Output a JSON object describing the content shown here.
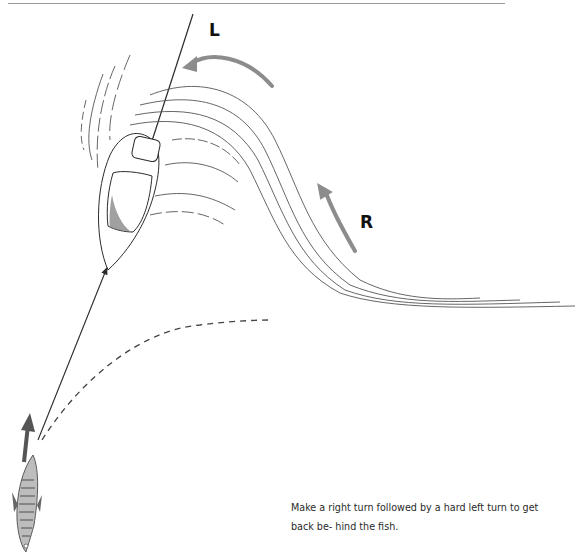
{
  "figure": {
    "turn_labels": {
      "left": "L",
      "right": "R"
    },
    "elements": {
      "boat": "boat-top-view",
      "fishing_line": "line-to-fish",
      "wake": "boat-wake",
      "fish": "fish-top-view",
      "fish_direction": "fish-arrow-up",
      "path": "dashed-boat-path",
      "turn_arrows": [
        "left-turn-arrow",
        "right-turn-arrow"
      ]
    },
    "colors": {
      "ink": "#2b2b2b",
      "turn_arrow": "#8c8c8c",
      "rule": "#9a9a9a"
    }
  },
  "caption": {
    "text": "Make a right turn followed by a hard left turn to get back be- hind the fish."
  }
}
